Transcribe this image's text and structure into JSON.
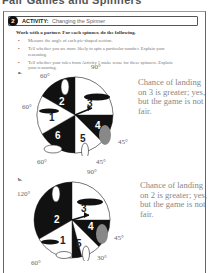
{
  "header": {
    "cropped_heading": "Fair Games and Spinners"
  },
  "activity": {
    "number": "2",
    "label": "ACTIVITY:",
    "title": "Changing the Spinner"
  },
  "instructions": {
    "intro": "Work with a partner. For each spinner, do the following.",
    "bullets": [
      "Measure the angle of each pie-shaped section.",
      "Tell whether you are more likely to spin a particular number. Explain your reasoning.",
      "Tell whether your rules from Activity 1 make sense for these spinners. Explain your reasoning."
    ]
  },
  "spinners": [
    {
      "letter": "a.",
      "sections": [
        {
          "number": "1",
          "angle": "60°",
          "fill": "white"
        },
        {
          "number": "2",
          "angle": "60°",
          "fill": "black"
        },
        {
          "number": "3",
          "angle": "90°",
          "fill": "white"
        },
        {
          "number": "4",
          "angle": "45°",
          "fill": "black"
        },
        {
          "number": "5",
          "angle": "45°",
          "fill": "white"
        },
        {
          "number": "6",
          "angle": "60°",
          "fill": "black"
        }
      ],
      "angle_labels": [
        "60°",
        "90°",
        "60°",
        "45°",
        "60°",
        "45°"
      ],
      "answer": "Chance of landing on 3 is greater; yes, but the game is not fair."
    },
    {
      "letter": "b.",
      "sections": [
        {
          "number": "1",
          "angle": "60°",
          "fill": "white"
        },
        {
          "number": "2",
          "angle": "120°",
          "fill": "black"
        },
        {
          "number": "3",
          "angle": "90°",
          "fill": "white"
        },
        {
          "number": "4",
          "angle": "45°",
          "fill": "black"
        },
        {
          "number": "5",
          "angle": "30°",
          "fill": "white"
        },
        {
          "number": "6",
          "angle": "15°",
          "fill": "black"
        }
      ],
      "angle_labels": [
        "120°",
        "90°",
        "45°",
        "60°",
        "30°"
      ],
      "answer": "Chance of landing on 2 is greater; yes, but the game is not fair."
    }
  ],
  "colors": {
    "ink": "#222222",
    "answer_text": "#888888",
    "frame": "#666666"
  }
}
